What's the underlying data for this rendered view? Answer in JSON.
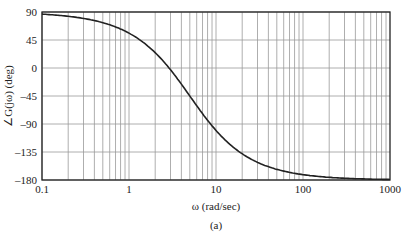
{
  "chart_data": {
    "type": "line",
    "title": "",
    "xlabel": "ω (rad/sec)",
    "ylabel": "∠G(jω) (deg)",
    "caption": "(a)",
    "xscale": "log",
    "xlim": [
      0.1,
      1000
    ],
    "ylim": [
      -180,
      90
    ],
    "xticks": [
      "0.1",
      "1",
      "10",
      "100",
      "1000"
    ],
    "yticks": [
      "90",
      "45",
      "0",
      "-45",
      "-90",
      "-135",
      "-180"
    ],
    "grid": true,
    "series": [
      {
        "name": "phase",
        "x": [
          0.1,
          0.2,
          0.5,
          1,
          2,
          3,
          5,
          8,
          10,
          20,
          50,
          100,
          200,
          500,
          1000
        ],
        "y": [
          86.6,
          83.1,
          72.8,
          56.1,
          25.6,
          4.4,
          -45,
          -88.6,
          -102.4,
          -139.7,
          -162.9,
          -171.4,
          -175.7,
          -178.3,
          -179.1
        ]
      }
    ]
  }
}
